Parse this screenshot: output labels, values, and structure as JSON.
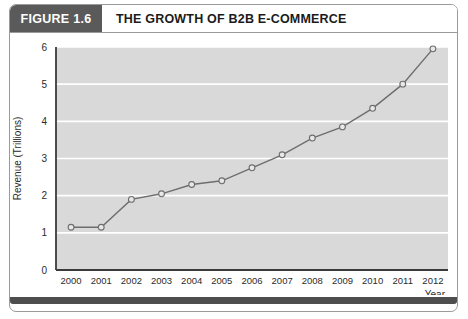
{
  "figure": {
    "tag_label": "FIGURE 1.6",
    "title": "THE GROWTH OF B2B E-COMMERCE"
  },
  "colors": {
    "tag_background": "#5a5a5a",
    "title_text": "#1b1b1b",
    "frame_border": "#9a9a9a",
    "bottom_bar": "#4e4e4e",
    "plot_background": "#d9d9d9",
    "gridline": "#ffffff",
    "axis_line": "#3a3a3a",
    "series_line": "#6e6e6e",
    "marker_fill": "#e8e8e8",
    "marker_stroke": "#6e6e6e"
  },
  "chart_data": {
    "type": "line",
    "title": "THE GROWTH OF B2B E-COMMERCE",
    "xlabel": "Year",
    "ylabel": "Revenue (Trillions)",
    "categories": [
      "2000",
      "2001",
      "2002",
      "2003",
      "2004",
      "2005",
      "2006",
      "2007",
      "2008",
      "2009",
      "2010",
      "2011",
      "2012"
    ],
    "values": [
      1.15,
      1.15,
      1.9,
      2.05,
      2.3,
      2.4,
      2.75,
      3.1,
      3.55,
      3.85,
      4.35,
      5.0,
      5.95
    ],
    "series": [
      {
        "name": "Revenue",
        "values": [
          1.15,
          1.15,
          1.9,
          2.05,
          2.3,
          2.4,
          2.75,
          3.1,
          3.55,
          3.85,
          4.35,
          5.0,
          5.95
        ]
      }
    ],
    "ylim": [
      0,
      6
    ],
    "yticks": [
      "0",
      "1",
      "2",
      "3",
      "4",
      "5",
      "6"
    ],
    "ytick_values": [
      0,
      1,
      2,
      3,
      4,
      5,
      6
    ],
    "xticks": [
      "2000",
      "2001",
      "2002",
      "2003",
      "2004",
      "2005",
      "2006",
      "2007",
      "2008",
      "2009",
      "2010",
      "2011",
      "2012"
    ],
    "grid": true,
    "grid_axis": "y",
    "legend": false,
    "markers": "open-circle"
  }
}
